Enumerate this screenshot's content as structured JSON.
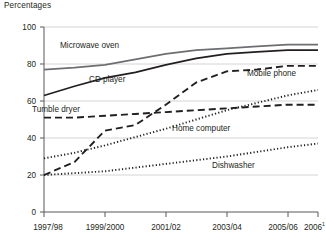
{
  "chart_data": {
    "type": "line",
    "title": "Percentages",
    "xlabel": "",
    "ylabel": "Percentages",
    "ylim": [
      0,
      100
    ],
    "yticks": [
      0,
      20,
      40,
      60,
      80,
      100
    ],
    "grid": true,
    "legend_position": "inline-labels",
    "x": [
      "1997/98",
      "1998/99",
      "1999/2000",
      "2000/01",
      "2001/02",
      "2002/03",
      "2003/04",
      "2004/05",
      "2005/06",
      "2006"
    ],
    "xticks": [
      "1997/98",
      "1999/2000",
      "2001/02",
      "2003/04",
      "2005/06",
      "2006"
    ],
    "xtick_footnote": "1",
    "series": [
      {
        "name": "Microwave oven",
        "style": "solid",
        "color": "#6d6e71",
        "values": [
          77,
          78,
          79.5,
          82.5,
          85.5,
          87.5,
          88.5,
          89.5,
          90.5,
          90.5
        ]
      },
      {
        "name": "CD player",
        "style": "solid",
        "color": "#231f20",
        "values": [
          63,
          68,
          72.5,
          75.5,
          79.5,
          83,
          85.5,
          86.5,
          87.5,
          87.5
        ]
      },
      {
        "name": "Mobile phone",
        "style": "dashed",
        "color": "#231f20",
        "values": [
          20,
          27,
          44,
          47,
          58,
          70,
          76,
          77,
          79,
          79
        ]
      },
      {
        "name": "Tumble dryer",
        "style": "dashed",
        "color": "#231f20",
        "values": [
          51,
          51,
          52,
          53,
          54,
          55,
          56,
          57,
          58,
          58
        ]
      },
      {
        "name": "Home computer",
        "style": "dotted",
        "color": "#231f20",
        "values": [
          29,
          32,
          36,
          40.5,
          45,
          50,
          55,
          59,
          63,
          66
        ]
      },
      {
        "name": "Dishwasher",
        "style": "dotted",
        "color": "#231f20",
        "values": [
          20,
          21,
          22,
          24,
          26,
          28,
          30,
          32.5,
          35,
          37
        ]
      }
    ],
    "series_label_positions": [
      {
        "name": "Microwave oven",
        "x": 60,
        "y": 48
      },
      {
        "name": "CD player",
        "x": 89,
        "y": 82
      },
      {
        "name": "Mobile phone",
        "x": 247,
        "y": 76
      },
      {
        "name": "Tumble dryer",
        "x": 32,
        "y": 112
      },
      {
        "name": "Home computer",
        "x": 172,
        "y": 131
      },
      {
        "name": "Dishwasher",
        "x": 212,
        "y": 168
      }
    ]
  }
}
